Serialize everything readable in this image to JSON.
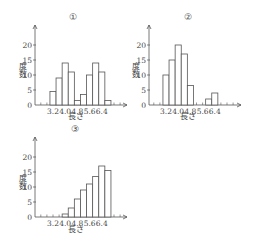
{
  "chart_data": [
    {
      "type": "bar",
      "panel_label": "①",
      "title": "①",
      "xlabel": "長さ",
      "ylabel": "度数",
      "x_tick_labels": [
        "3.2",
        "4.0",
        "4.8",
        "5.6",
        "6.4"
      ],
      "y_tick_labels": [
        "0",
        "5",
        "10",
        "15",
        "20"
      ],
      "ylim": [
        0,
        25
      ],
      "bin_width": 0.4,
      "bin_start": 3.0,
      "bins": [
        "3.0-3.4",
        "3.4-3.8",
        "3.8-4.2",
        "4.2-4.6",
        "4.6-5.0",
        "5.0-5.4",
        "5.4-5.8",
        "5.8-6.2",
        "6.2-6.6",
        "6.6-7.0"
      ],
      "values": [
        4.5,
        9,
        14,
        11,
        1.5,
        3.5,
        10,
        14,
        11,
        1.5
      ],
      "grid": false
    },
    {
      "type": "bar",
      "panel_label": "②",
      "title": "②",
      "xlabel": "長さ",
      "ylabel": "度数",
      "x_tick_labels": [
        "3.2",
        "4.0",
        "4.8",
        "5.6",
        "6.4"
      ],
      "y_tick_labels": [
        "0",
        "5",
        "10",
        "15",
        "20"
      ],
      "ylim": [
        0,
        25
      ],
      "bin_width": 0.4,
      "bin_start": 3.0,
      "bins": [
        "3.0-3.4",
        "3.4-3.8",
        "3.8-4.2",
        "4.2-4.6",
        "4.6-5.0",
        "5.0-5.4",
        "5.4-5.8",
        "5.8-6.2",
        "6.2-6.6"
      ],
      "values": [
        10,
        15,
        20,
        17,
        6.5,
        0,
        0,
        2,
        4
      ],
      "grid": false
    },
    {
      "type": "bar",
      "panel_label": "③",
      "title": "③",
      "xlabel": "長さ",
      "ylabel": "度数",
      "x_tick_labels": [
        "3.2",
        "4.0",
        "4.8",
        "5.6",
        "6.4"
      ],
      "y_tick_labels": [
        "0",
        "5",
        "10",
        "15",
        "20"
      ],
      "ylim": [
        0,
        25
      ],
      "bin_width": 0.4,
      "bin_start": 3.8,
      "bins": [
        "3.8-4.2",
        "4.2-4.6",
        "4.6-5.0",
        "5.0-5.4",
        "5.4-5.8",
        "5.8-6.2",
        "6.2-6.6",
        "6.6-7.0"
      ],
      "values": [
        1,
        3,
        6,
        9,
        11,
        13.5,
        17,
        15.5
      ],
      "grid": false
    }
  ]
}
